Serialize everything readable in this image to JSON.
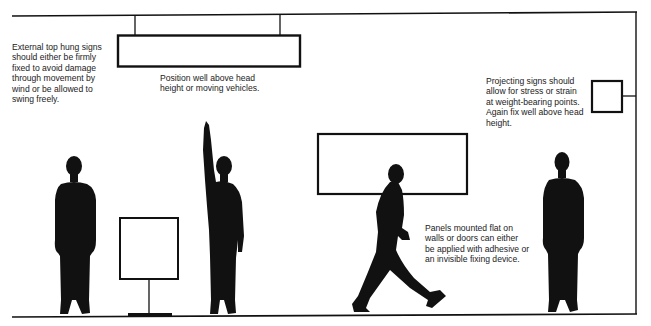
{
  "diagram": {
    "colors": {
      "ink": "#111111",
      "background": "#ffffff",
      "text": "#222222"
    },
    "annotations": {
      "top_hung": "External top hung signs\nshould either be firmly\nfixed to avoid damage\nthrough movement by\nwind or be allowed to\nswing freely.",
      "position_above": "Position well above head\nheight or moving vehicles.",
      "projecting": "Projecting signs should\nallow for stress or strain\nat weight-bearing points.\nAgain fix well above head\nheight.",
      "panels": "Panels mounted flat on\nwalls or doors can either\nbe applied with adhesive or\nan invisible fixing device."
    },
    "elements": [
      {
        "id": "ceiling-line",
        "type": "line"
      },
      {
        "id": "wall-line",
        "type": "line"
      },
      {
        "id": "floor-line",
        "type": "line"
      },
      {
        "id": "top-hung-sign",
        "type": "rectangle",
        "suspended_by": 2
      },
      {
        "id": "projecting-sign",
        "type": "square",
        "bracket": "wall"
      },
      {
        "id": "wall-panel",
        "type": "rectangle"
      },
      {
        "id": "freestanding-sign",
        "type": "square",
        "post": true
      },
      {
        "id": "figure-standing-left",
        "type": "silhouette"
      },
      {
        "id": "figure-arm-raised",
        "type": "silhouette"
      },
      {
        "id": "figure-walking",
        "type": "silhouette"
      },
      {
        "id": "figure-standing-right",
        "type": "silhouette"
      }
    ]
  }
}
